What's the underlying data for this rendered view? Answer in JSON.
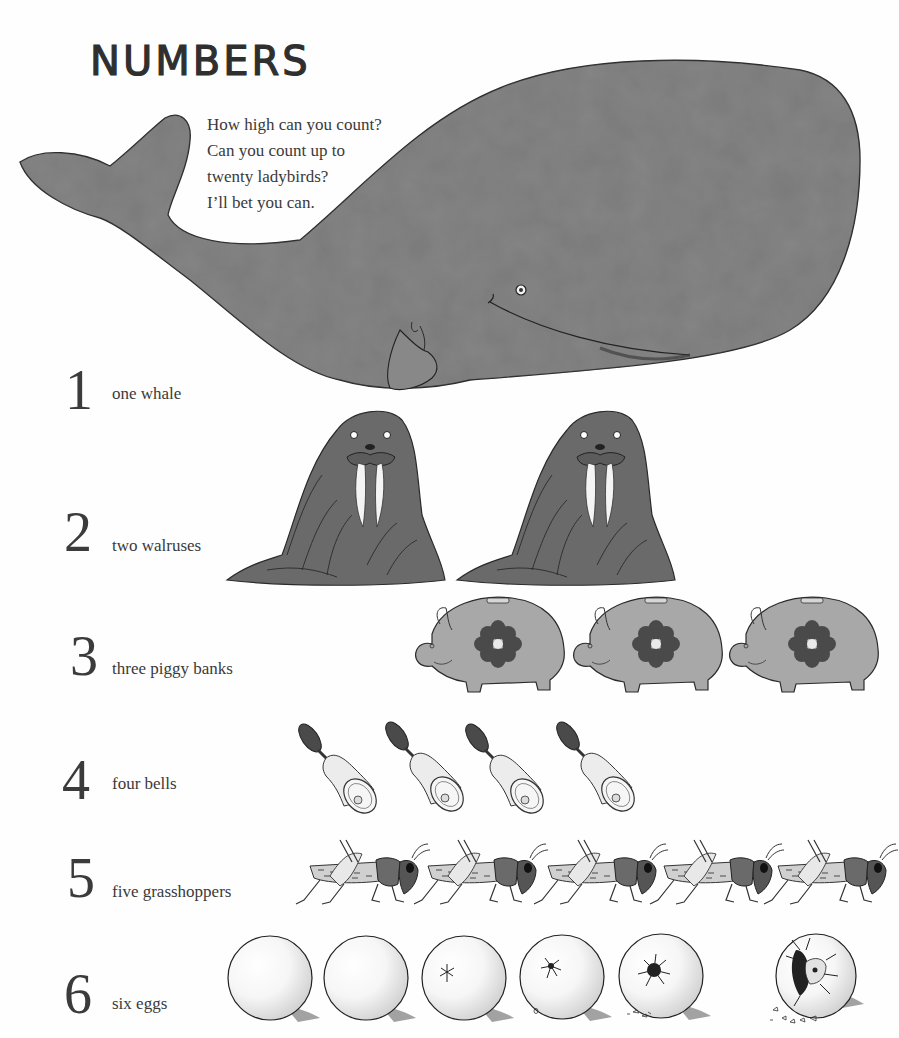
{
  "page": {
    "title": "NUMBERS",
    "intro_lines": [
      "How high can you count?",
      "Can you count up to",
      "twenty ladybirds?",
      "I’ll bet you can."
    ]
  },
  "rows": [
    {
      "number": "1",
      "label": "one whale",
      "item": "whale-icon",
      "count": 1
    },
    {
      "number": "2",
      "label": "two walruses",
      "item": "walrus-icon",
      "count": 2
    },
    {
      "number": "3",
      "label": "three piggy banks",
      "item": "piggy-bank-icon",
      "count": 3
    },
    {
      "number": "4",
      "label": "four bells",
      "item": "bell-icon",
      "count": 4
    },
    {
      "number": "5",
      "label": "five grasshoppers",
      "item": "grasshopper-icon",
      "count": 5
    },
    {
      "number": "6",
      "label": "six eggs",
      "item": "egg-icon",
      "count": 6
    }
  ],
  "colors": {
    "background": "#fefefe",
    "ink": "#2f2f2f",
    "whale_gray": "#7a7a7a",
    "walrus_gray": "#6a6a6a",
    "piggy_gray": "#a8a8a8",
    "flower_dark": "#4a4a4a",
    "egg_shade": "#e2e2e2"
  }
}
